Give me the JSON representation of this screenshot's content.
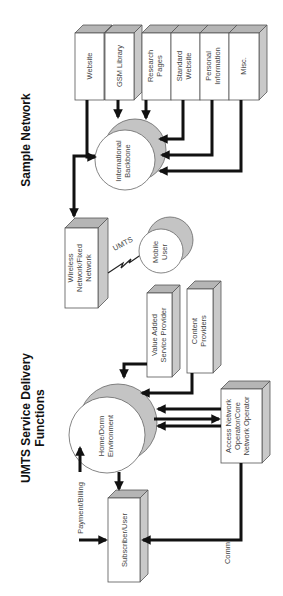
{
  "titles": {
    "sample_network": "Sample Network",
    "umts_line1": "UMTS Service Delivery",
    "umts_line2": "Functions"
  },
  "sample_network": {
    "sources": [
      {
        "id": "website",
        "lines": [
          "Website"
        ]
      },
      {
        "id": "gsm-library",
        "lines": [
          "GSM Library"
        ]
      },
      {
        "id": "research-pages",
        "lines": [
          "Research",
          "Pages"
        ]
      },
      {
        "id": "standard-website",
        "lines": [
          "Standard",
          "Website"
        ]
      },
      {
        "id": "personal-information",
        "lines": [
          "Personal",
          "Information"
        ]
      },
      {
        "id": "misc",
        "lines": [
          "Misc."
        ]
      }
    ],
    "backbone": {
      "lines": [
        "International",
        "Backbone"
      ]
    },
    "wireless": {
      "lines": [
        "Wireless",
        "Network/Fixed",
        "Network"
      ]
    },
    "link_label": "UMTS",
    "mobile_user": {
      "lines": [
        "Mobile",
        "User"
      ]
    }
  },
  "umts": {
    "vasp": {
      "lines": [
        "Value Added",
        "Service Provider"
      ]
    },
    "content": {
      "lines": [
        "Content",
        "Providers"
      ]
    },
    "home": {
      "lines": [
        "Home/Dorm",
        "Environment"
      ]
    },
    "access": {
      "lines": [
        "Access Network",
        "Operator/Core",
        "Network Operator"
      ]
    },
    "subscriber": {
      "lines": [
        "Subscriber/User"
      ]
    },
    "payment_label": "Payment/Billing",
    "comm_label": "Comm"
  },
  "colors": {
    "box_face": "#ffffff",
    "box_side": "#c9c9c9",
    "box_top": "#b5b5b5",
    "arrow": "#111111",
    "text": "#444444"
  }
}
